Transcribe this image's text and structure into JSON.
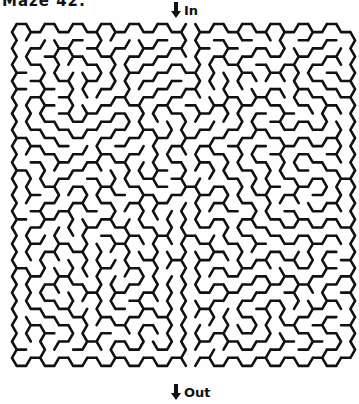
{
  "header": {
    "title": "Maze 42:",
    "right_text": ""
  },
  "maze": {
    "type": "hexagonal",
    "columns": 13,
    "rows": 12,
    "seed": 42,
    "entrance_column": 6,
    "exit_column": 6,
    "wall_color": "#111111",
    "background_color": "#fefefe"
  },
  "labels": {
    "in": "In",
    "out": "Out"
  }
}
